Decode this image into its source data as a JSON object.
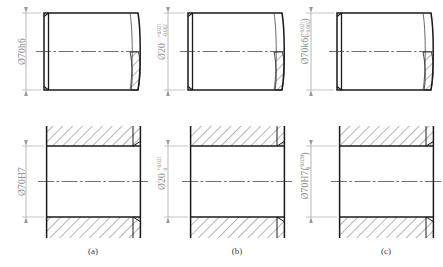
{
  "figure": {
    "title": "",
    "columns": [
      {
        "id": "a",
        "caption": "(a)",
        "shaft": {
          "dimension_prefix": "Ø70h6",
          "dimension_upper": "",
          "dimension_lower": "",
          "dimension_suffix": ""
        },
        "hole": {
          "dimension_prefix": "Ø70H7",
          "dimension_upper": "",
          "dimension_lower": "",
          "dimension_suffix": ""
        }
      },
      {
        "id": "b",
        "caption": "(b)",
        "shaft": {
          "dimension_prefix": "Ø20",
          "dimension_upper": "+0.021",
          "dimension_lower": "-0.002",
          "dimension_suffix": ""
        },
        "hole": {
          "dimension_prefix": "Ø20",
          "dimension_upper": "+0.021",
          "dimension_lower": "0",
          "dimension_suffix": ""
        }
      },
      {
        "id": "c",
        "caption": "(c)",
        "shaft": {
          "dimension_prefix": "Ø70k6(",
          "dimension_upper": "+0.021",
          "dimension_lower": "+0.002",
          "dimension_suffix": ")"
        },
        "hole": {
          "dimension_prefix": "Ø70H7(",
          "dimension_upper": "+0.030",
          "dimension_lower": "0",
          "dimension_suffix": ")"
        }
      }
    ],
    "colors": {
      "outline": "#1a1a1a",
      "thin_line": "#555555",
      "dim_line": "#9a9a9a",
      "dim_text": "#8d8d8d",
      "caption_text": "#3b3b3b",
      "hatch": "#2b2b2b",
      "background": "#ffffff"
    },
    "view_labels": {
      "top_view": "shaft-elevation-with-break",
      "bottom_view": "bore-section-view"
    }
  }
}
